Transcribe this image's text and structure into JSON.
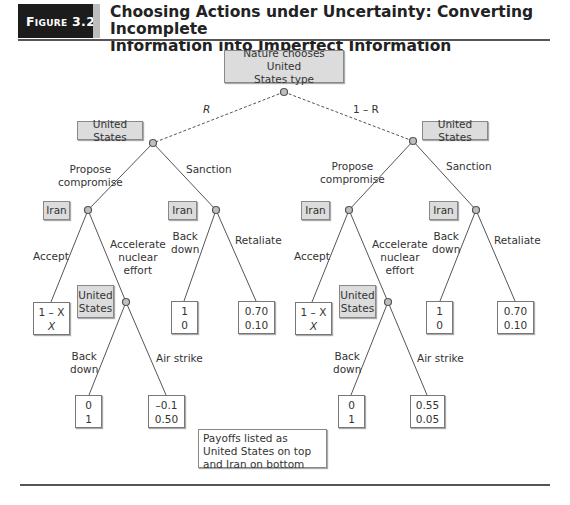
{
  "figure": {
    "badge": "Figure 3.2",
    "title_line1": "Choosing Actions under Uncertainty: Converting Incomplete",
    "title_line2": "Information into Imperfect Information"
  },
  "nature": {
    "label_line1": "Nature chooses United",
    "label_line2": "States type",
    "prob_left": "R",
    "prob_right": "1 – R"
  },
  "players": {
    "us": "United States",
    "us_line1": "United",
    "us_line2": "States",
    "iran": "Iran"
  },
  "actions": {
    "propose_line1": "Propose",
    "propose_line2": "compromise",
    "sanction": "Sanction",
    "accept": "Accept",
    "accelerate_line1": "Accelerate",
    "accelerate_line2": "nuclear",
    "accelerate_line3": "effort",
    "back_line1": "Back",
    "back_line2": "down",
    "retaliate": "Retaliate",
    "air_strike": "Air strike"
  },
  "left_subtree": {
    "accept_payoff": {
      "us": "1 – X",
      "iran": "X"
    },
    "backdown_after_accel": {
      "us": "0",
      "iran": "1"
    },
    "airstrike": {
      "us": "–0.1",
      "iran": "0.50"
    },
    "sanction_backdown": {
      "us": "1",
      "iran": "0"
    },
    "sanction_retaliate": {
      "us": "0.70",
      "iran": "0.10"
    }
  },
  "right_subtree": {
    "accept_payoff": {
      "us": "1 – X",
      "iran": "X"
    },
    "backdown_after_accel": {
      "us": "0",
      "iran": "1"
    },
    "airstrike": {
      "us": "0.55",
      "iran": "0.05"
    },
    "sanction_backdown": {
      "us": "1",
      "iran": "0"
    },
    "sanction_retaliate": {
      "us": "0.70",
      "iran": "0.10"
    }
  },
  "note": "Payoffs listed as United States on top and Iran on bottom",
  "colors": {
    "node_fill": "#bfbfbf",
    "box_fill": "#dcdcdc",
    "line": "#444444",
    "badge": "#1c1c1c"
  }
}
